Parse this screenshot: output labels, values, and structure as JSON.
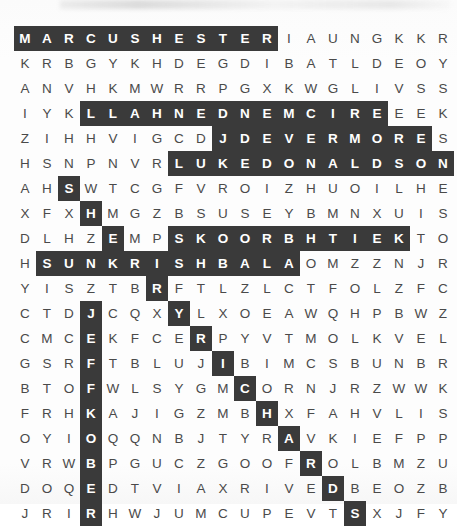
{
  "puzzle": {
    "type": "word-search",
    "rows": 19,
    "cols": 20,
    "cell_size_px": 22,
    "colors": {
      "highlight_background": "#3a3a3a",
      "highlight_text": "#ffffff",
      "letter_text": "#4a4a4a",
      "page_background": "#fdfdfd"
    },
    "grid": [
      [
        "M",
        "A",
        "R",
        "C",
        "U",
        "S",
        "H",
        "E",
        "S",
        "T",
        "E",
        "R",
        "I",
        "A",
        "U",
        "N",
        "G",
        "K",
        "K",
        "R"
      ],
      [
        "K",
        "R",
        "B",
        "G",
        "Y",
        "K",
        "H",
        "D",
        "E",
        "G",
        "D",
        "I",
        "B",
        "A",
        "T",
        "L",
        "D",
        "E",
        "O",
        "Y"
      ],
      [
        "A",
        "N",
        "V",
        "H",
        "K",
        "M",
        "W",
        "R",
        "R",
        "P",
        "G",
        "X",
        "K",
        "W",
        "G",
        "L",
        "I",
        "V",
        "S",
        "S"
      ],
      [
        "I",
        "Y",
        "K",
        "L",
        "L",
        "A",
        "H",
        "N",
        "E",
        "D",
        "N",
        "E",
        "M",
        "C",
        "I",
        "R",
        "E",
        "E",
        "E",
        "K"
      ],
      [
        "Z",
        "I",
        "H",
        "H",
        "V",
        "I",
        "G",
        "C",
        "D",
        "J",
        "D",
        "E",
        "V",
        "E",
        "R",
        "M",
        "O",
        "R",
        "E",
        "S"
      ],
      [
        "H",
        "S",
        "N",
        "P",
        "N",
        "V",
        "R",
        "L",
        "U",
        "K",
        "E",
        "D",
        "O",
        "N",
        "A",
        "L",
        "D",
        "S",
        "O",
        "N"
      ],
      [
        "A",
        "H",
        "S",
        "W",
        "T",
        "C",
        "G",
        "F",
        "V",
        "R",
        "O",
        "I",
        "Z",
        "H",
        "U",
        "O",
        "I",
        "L",
        "H",
        "E"
      ],
      [
        "X",
        "F",
        "X",
        "H",
        "M",
        "G",
        "Z",
        "B",
        "S",
        "U",
        "S",
        "E",
        "Y",
        "B",
        "M",
        "N",
        "X",
        "U",
        "I",
        "S"
      ],
      [
        "D",
        "L",
        "H",
        "Z",
        "E",
        "M",
        "P",
        "S",
        "K",
        "O",
        "O",
        "R",
        "B",
        "H",
        "T",
        "I",
        "E",
        "K",
        "T",
        "O"
      ],
      [
        "H",
        "S",
        "U",
        "N",
        "K",
        "R",
        "I",
        "S",
        "H",
        "B",
        "A",
        "L",
        "A",
        "O",
        "M",
        "Z",
        "Z",
        "N",
        "J",
        "R"
      ],
      [
        "Y",
        "I",
        "S",
        "Z",
        "T",
        "B",
        "R",
        "F",
        "T",
        "L",
        "Z",
        "L",
        "C",
        "T",
        "F",
        "O",
        "L",
        "Z",
        "F",
        "C"
      ],
      [
        "C",
        "T",
        "D",
        "J",
        "C",
        "Q",
        "X",
        "Y",
        "L",
        "X",
        "O",
        "E",
        "A",
        "W",
        "Q",
        "H",
        "P",
        "B",
        "W",
        "Z"
      ],
      [
        "C",
        "M",
        "C",
        "E",
        "K",
        "F",
        "C",
        "E",
        "R",
        "P",
        "Y",
        "V",
        "T",
        "M",
        "O",
        "L",
        "K",
        "V",
        "E",
        "L"
      ],
      [
        "G",
        "S",
        "R",
        "F",
        "T",
        "B",
        "L",
        "U",
        "J",
        "I",
        "B",
        "I",
        "M",
        "C",
        "S",
        "B",
        "U",
        "N",
        "B",
        "R"
      ],
      [
        "B",
        "T",
        "O",
        "F",
        "W",
        "L",
        "S",
        "Y",
        "G",
        "M",
        "C",
        "O",
        "R",
        "N",
        "J",
        "R",
        "Z",
        "W",
        "W",
        "K"
      ],
      [
        "F",
        "R",
        "H",
        "K",
        "A",
        "J",
        "I",
        "G",
        "Z",
        "M",
        "B",
        "H",
        "X",
        "F",
        "A",
        "H",
        "V",
        "L",
        "I",
        "S"
      ],
      [
        "O",
        "Y",
        "I",
        "O",
        "Q",
        "Q",
        "N",
        "B",
        "J",
        "T",
        "Y",
        "R",
        "A",
        "V",
        "K",
        "I",
        "E",
        "F",
        "P",
        "P"
      ],
      [
        "V",
        "R",
        "W",
        "B",
        "P",
        "G",
        "U",
        "C",
        "Z",
        "G",
        "O",
        "O",
        "F",
        "R",
        "O",
        "L",
        "B",
        "M",
        "Z",
        "U"
      ],
      [
        "D",
        "O",
        "Q",
        "E",
        "D",
        "T",
        "V",
        "I",
        "A",
        "X",
        "R",
        "I",
        "V",
        "E",
        "D",
        "B",
        "E",
        "O",
        "Z",
        "B"
      ],
      [
        "J",
        "R",
        "I",
        "R",
        "H",
        "W",
        "J",
        "U",
        "M",
        "C",
        "U",
        "P",
        "E",
        "V",
        "T",
        "S",
        "X",
        "J",
        "F",
        "Y"
      ]
    ],
    "highlights": [
      [
        0,
        0
      ],
      [
        0,
        1
      ],
      [
        0,
        2
      ],
      [
        0,
        3
      ],
      [
        0,
        4
      ],
      [
        0,
        5
      ],
      [
        0,
        6
      ],
      [
        0,
        7
      ],
      [
        0,
        8
      ],
      [
        0,
        9
      ],
      [
        0,
        10
      ],
      [
        0,
        11
      ],
      [
        3,
        3
      ],
      [
        3,
        4
      ],
      [
        3,
        5
      ],
      [
        3,
        6
      ],
      [
        3,
        7
      ],
      [
        3,
        8
      ],
      [
        3,
        9
      ],
      [
        3,
        10
      ],
      [
        3,
        11
      ],
      [
        3,
        12
      ],
      [
        3,
        13
      ],
      [
        3,
        14
      ],
      [
        3,
        15
      ],
      [
        3,
        16
      ],
      [
        4,
        9
      ],
      [
        4,
        10
      ],
      [
        4,
        11
      ],
      [
        4,
        12
      ],
      [
        4,
        13
      ],
      [
        4,
        14
      ],
      [
        4,
        15
      ],
      [
        4,
        16
      ],
      [
        4,
        17
      ],
      [
        4,
        18
      ],
      [
        5,
        7
      ],
      [
        5,
        8
      ],
      [
        5,
        9
      ],
      [
        5,
        10
      ],
      [
        5,
        11
      ],
      [
        5,
        12
      ],
      [
        5,
        13
      ],
      [
        5,
        14
      ],
      [
        5,
        15
      ],
      [
        5,
        16
      ],
      [
        5,
        17
      ],
      [
        5,
        18
      ],
      [
        5,
        19
      ],
      [
        6,
        2
      ],
      [
        7,
        3
      ],
      [
        8,
        4
      ],
      [
        8,
        7
      ],
      [
        8,
        8
      ],
      [
        8,
        9
      ],
      [
        8,
        10
      ],
      [
        8,
        11
      ],
      [
        8,
        12
      ],
      [
        8,
        13
      ],
      [
        8,
        14
      ],
      [
        8,
        15
      ],
      [
        8,
        16
      ],
      [
        8,
        17
      ],
      [
        9,
        1
      ],
      [
        9,
        2
      ],
      [
        9,
        3
      ],
      [
        9,
        4
      ],
      [
        9,
        5
      ],
      [
        9,
        6
      ],
      [
        9,
        7
      ],
      [
        9,
        8
      ],
      [
        9,
        9
      ],
      [
        9,
        10
      ],
      [
        9,
        11
      ],
      [
        9,
        12
      ],
      [
        10,
        6
      ],
      [
        11,
        3
      ],
      [
        11,
        7
      ],
      [
        12,
        3
      ],
      [
        12,
        8
      ],
      [
        13,
        3
      ],
      [
        13,
        9
      ],
      [
        14,
        3
      ],
      [
        14,
        10
      ],
      [
        15,
        3
      ],
      [
        15,
        11
      ],
      [
        16,
        3
      ],
      [
        16,
        12
      ],
      [
        17,
        3
      ],
      [
        17,
        13
      ],
      [
        18,
        3
      ],
      [
        18,
        14
      ],
      [
        19,
        3
      ],
      [
        19,
        15
      ]
    ],
    "hidden_words": [
      "MARCUS HESTER",
      "ERIC MENDENHALL",
      "J DEVERMORE",
      "LUKE DONALDSON",
      "KEITH BROOKS",
      "SUN KRISHBALA",
      "JEFF KOBER",
      "RICHARDS"
    ]
  }
}
